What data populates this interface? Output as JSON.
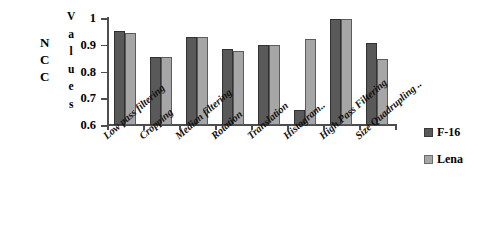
{
  "chart_data": {
    "type": "bar",
    "title": "",
    "xlabel": "",
    "ylabel": "NCC Values",
    "ylabel_parts": [
      "NCC",
      "Values"
    ],
    "ylim": [
      0.6,
      1
    ],
    "yticks": [
      "0.6",
      "0.7",
      "0.8",
      "0.9",
      "1"
    ],
    "ytick_values": [
      0.6,
      0.7,
      0.8,
      0.9,
      1.0
    ],
    "grid": false,
    "legend_position": "right",
    "categories": [
      "Low pass filtering",
      "Cropping",
      "Median filtering",
      "Rotation",
      "Translation",
      "Histogram..",
      "High Pass Filtering",
      "Size Quadrupling .."
    ],
    "series": [
      {
        "name": "F-16",
        "color": "#595959",
        "values": [
          0.95,
          0.855,
          0.93,
          0.885,
          0.9,
          0.655,
          0.995,
          0.905
        ]
      },
      {
        "name": "Lena",
        "color": "#a6a6a6",
        "values": [
          0.945,
          0.855,
          0.928,
          0.878,
          0.898,
          0.92,
          0.995,
          0.848
        ]
      }
    ]
  },
  "axis": {
    "y_title_lines": [
      "N",
      "C",
      "C"
    ],
    "values_title_lines": [
      "V",
      "a",
      "l",
      "u",
      "e",
      "s"
    ]
  },
  "legend": {
    "items": [
      {
        "label": "F-16",
        "color": "#595959"
      },
      {
        "label": "Lena",
        "color": "#a6a6a6"
      }
    ]
  }
}
